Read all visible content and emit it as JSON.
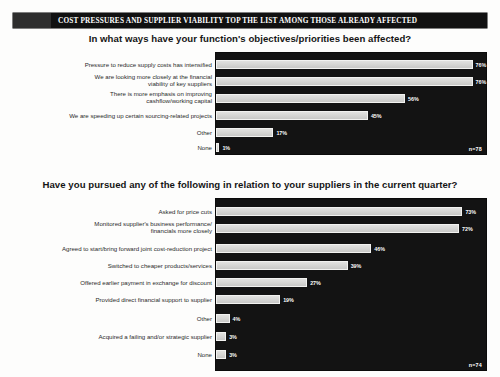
{
  "banner": {
    "title": "COST PRESSURES AND SUPPLIER VIABILITY TOP THE LIST AMONG THOSE ALREADY AFFECTED"
  },
  "chart_data": [
    {
      "type": "bar",
      "orientation": "horizontal",
      "title": "In what ways have your function's objectives/priorities been affected?",
      "xlabel": "",
      "ylabel": "",
      "xlim": [
        0,
        80
      ],
      "grid": false,
      "legend": "none",
      "sample_note": "n=78",
      "categories": [
        "Pressure to reduce supply costs has intensified",
        "We are looking more closely at the financial\nviability of key suppliers",
        "There is more emphasis on improving\ncashflow/working capital",
        "We are speeding up certain sourcing-related projects",
        "Other",
        "None"
      ],
      "values": [
        76,
        76,
        56,
        45,
        17,
        1
      ],
      "value_labels": [
        "76%",
        "76%",
        "56%",
        "45%",
        "17%",
        "1%"
      ]
    },
    {
      "type": "bar",
      "orientation": "horizontal",
      "title": "Have you pursued any of the following in relation to your suppliers in the current quarter?",
      "xlabel": "",
      "ylabel": "",
      "xlim": [
        0,
        80
      ],
      "grid": false,
      "legend": "none",
      "sample_note": "n=74",
      "categories": [
        "Asked for price cuts",
        "Monitored supplier's business performance/\nfinancials more closely",
        "Agreed to start/bring forward joint cost-reduction project",
        "Switched to cheaper products/services",
        "Offered earlier payment in exchange for discount",
        "Provided direct financial support to supplier",
        "Other",
        "Acquired a failing and/or strategic supplier",
        "None"
      ],
      "values": [
        73,
        72,
        46,
        39,
        27,
        19,
        4,
        3,
        3
      ],
      "value_labels": [
        "73%",
        "72%",
        "46%",
        "39%",
        "27%",
        "19%",
        "4%",
        "3%",
        "3%"
      ]
    }
  ]
}
